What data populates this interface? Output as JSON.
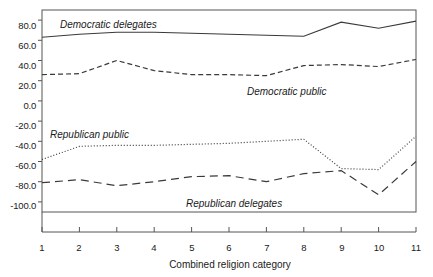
{
  "chart_data": {
    "type": "line",
    "title": "",
    "xlabel": "Combined religion category",
    "ylabel": "",
    "categories": [
      "1",
      "2",
      "3",
      "4",
      "5",
      "6",
      "7",
      "8",
      "9",
      "10",
      "11"
    ],
    "x": [
      1,
      2,
      3,
      4,
      5,
      6,
      7,
      8,
      9,
      10,
      11
    ],
    "xlim": [
      1,
      11
    ],
    "ylim": [
      -110,
      90
    ],
    "yticks": [
      80.0,
      60.0,
      40.0,
      20.0,
      0.0,
      -20.0,
      -40.0,
      -60.0,
      -80.0,
      -100.0
    ],
    "ytick_labels": [
      "80.0",
      "60.0",
      "40.0",
      "20.0",
      "0.0",
      "-20.0",
      "-40.0",
      "-60.0",
      "-80.0",
      "-100.0"
    ],
    "xticks": [
      1,
      2,
      3,
      4,
      5,
      6,
      7,
      8,
      9,
      10,
      11
    ],
    "xtick_labels": [
      "1",
      "2",
      "3",
      "4",
      "5",
      "6",
      "7",
      "8",
      "9",
      "10",
      "11"
    ],
    "grid": false,
    "legend": "inline-annotations",
    "series": [
      {
        "name": "Democratic delegates",
        "style": "solid",
        "color": "#3a3a3a",
        "values": [
          63,
          66,
          68,
          68,
          67,
          66,
          65,
          64,
          78,
          72,
          79
        ],
        "label_x": 3.0,
        "label_y": 79
      },
      {
        "name": "Democratic public",
        "style": "dashed",
        "color": "#3a3a3a",
        "values": [
          26,
          27,
          40,
          30,
          26,
          26,
          25,
          35,
          36,
          34,
          41
        ],
        "label_x": 7.4,
        "label_y": 16
      },
      {
        "name": "Republican public",
        "style": "dotted",
        "color": "#3a3a3a",
        "values": [
          -58,
          -45,
          -44,
          -44,
          -43,
          -42,
          -40,
          -38,
          -67,
          -68,
          -35
        ],
        "label_x": 1.5,
        "label_y": -28
      },
      {
        "name": "Republican delegates",
        "style": "longdash",
        "color": "#3a3a3a",
        "values": [
          -81,
          -78,
          -84,
          -80,
          -75,
          -74,
          -80,
          -72,
          -69,
          -93,
          -60
        ],
        "label_x": 5.5,
        "label_y": -92
      }
    ]
  },
  "axis": {
    "x_title": "Combined religion category"
  }
}
